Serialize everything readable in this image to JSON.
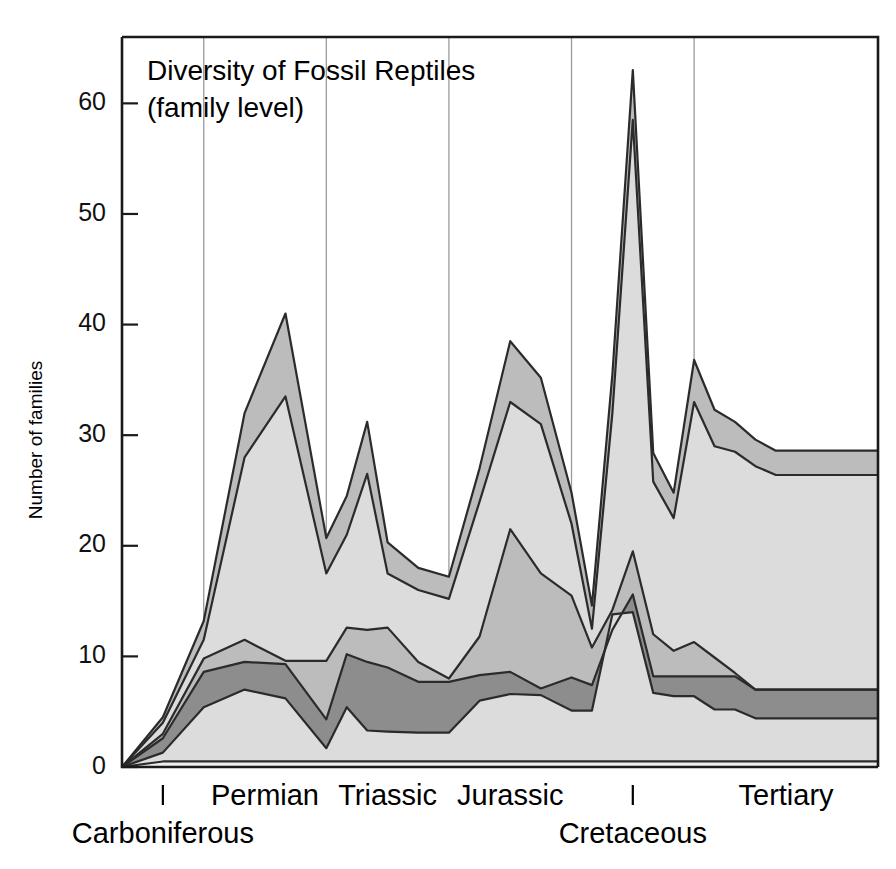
{
  "title": {
    "line1": "Diversity of Fossil Reptiles",
    "line2": "(family level)"
  },
  "axes": {
    "y_title": "Number of families",
    "y_ticks": [
      "0",
      "10",
      "20",
      "30",
      "40",
      "50",
      "60"
    ],
    "y_tick_values": [
      0,
      10,
      20,
      30,
      40,
      50,
      60
    ],
    "y_min": 0,
    "y_max": 66,
    "x_min": 0,
    "x_max": 37
  },
  "periods": [
    {
      "name": "Carboniferous",
      "label": "Carboniferous",
      "start": 0,
      "end": 4,
      "label_row": 2
    },
    {
      "name": "Permian",
      "label": "Permian",
      "start": 4,
      "end": 10,
      "label_row": 1
    },
    {
      "name": "Triassic",
      "label": "Triassic",
      "start": 10,
      "end": 16,
      "label_row": 1
    },
    {
      "name": "Jurassic",
      "label": "Jurassic",
      "start": 16,
      "end": 22,
      "label_row": 1
    },
    {
      "name": "Cretaceous",
      "label": "Cretaceous",
      "start": 22,
      "end": 28,
      "label_row": 2
    },
    {
      "name": "Tertiary",
      "label": "Tertiary",
      "start": 28,
      "end": 37,
      "label_row": 1
    }
  ],
  "colors": {
    "band_dark": "#8d8d8d",
    "band_mid": "#bcbcbc",
    "band_light": "#dcdcdc",
    "band_pale": "#eeeeee",
    "band_white": "#ffffff",
    "outline": "#2b2b2b",
    "grid": "#9a9a9a",
    "axis": "#1a1a1a",
    "background": "#ffffff"
  },
  "chart_data": {
    "type": "area",
    "title": "Diversity of Fossil Reptiles (family level)",
    "xlabel": "",
    "ylabel": "Number of families",
    "ylim": [
      0,
      66
    ],
    "xlim": [
      0,
      37
    ],
    "grid": "vertical gridlines at geological period boundaries",
    "legend": "none (stacked/overlapping shaded bands, unlabelled)",
    "x": [
      0,
      2,
      4,
      6,
      8,
      10,
      11,
      12,
      13,
      14.5,
      16,
      17.5,
      19,
      20.5,
      22,
      23,
      24,
      25,
      26,
      27,
      28,
      29,
      30,
      31,
      32,
      33,
      34,
      35,
      36,
      37
    ],
    "series": [
      {
        "name": "total-upper-envelope",
        "shade": "#bcbcbc",
        "values": [
          0,
          4.5,
          13.2,
          32.0,
          41.0,
          20.7,
          24.5,
          31.2,
          20.3,
          18.0,
          17.2,
          27.0,
          38.5,
          35.2,
          24.8,
          14.6,
          35.5,
          63.0,
          28.4,
          24.8,
          36.8,
          32.3,
          31.2,
          29.6,
          28.6,
          28.6,
          28.6,
          28.6,
          28.6,
          28.6
        ]
      },
      {
        "name": "second-envelope",
        "shade": "#dcdcdc",
        "values": [
          0,
          4.0,
          11.5,
          28.0,
          33.5,
          17.5,
          21.0,
          26.5,
          17.5,
          16.0,
          15.2,
          24.0,
          33.0,
          31.0,
          22.0,
          12.5,
          32.0,
          58.5,
          25.8,
          22.5,
          33.0,
          29.0,
          28.5,
          27.2,
          26.4,
          26.4,
          26.4,
          26.4,
          26.4,
          26.4
        ]
      },
      {
        "name": "mid-band-upper",
        "shade": "#bcbcbc",
        "values": [
          0,
          3.0,
          9.8,
          11.5,
          9.6,
          9.6,
          12.6,
          12.4,
          12.6,
          9.5,
          8.0,
          11.8,
          21.5,
          17.5,
          15.5,
          10.8,
          14.2,
          19.5,
          12.0,
          10.5,
          11.3,
          9.9,
          8.5,
          7.0,
          7.0,
          7.0,
          7.0,
          7.0,
          7.0,
          7.0
        ]
      },
      {
        "name": "mid-band-lower",
        "shade": "#8d8d8d",
        "values": [
          0,
          2.6,
          8.6,
          9.5,
          9.3,
          4.3,
          10.2,
          9.5,
          9.0,
          7.7,
          7.7,
          8.3,
          8.6,
          7.1,
          8.1,
          7.4,
          12.4,
          15.6,
          8.2,
          8.2,
          8.2,
          8.2,
          8.2,
          7.0,
          7.0,
          7.0,
          7.0,
          7.0,
          7.0,
          7.0
        ]
      },
      {
        "name": "lower-band-upper",
        "shade": "#dcdcdc",
        "values": [
          0,
          1.3,
          5.4,
          7.0,
          6.2,
          1.7,
          5.4,
          3.3,
          3.2,
          3.1,
          3.1,
          6.0,
          6.6,
          6.5,
          5.1,
          5.1,
          13.8,
          14.0,
          6.7,
          6.4,
          6.4,
          5.2,
          5.2,
          4.4,
          4.4,
          4.4,
          4.4,
          4.4,
          4.4,
          4.4
        ]
      },
      {
        "name": "baseline",
        "shade": "#eeeeee",
        "values": [
          0,
          0.5,
          0.5,
          0.5,
          0.5,
          0.5,
          0.5,
          0.5,
          0.5,
          0.5,
          0.5,
          0.5,
          0.5,
          0.5,
          0.5,
          0.5,
          0.5,
          0.5,
          0.5,
          0.5,
          0.5,
          0.5,
          0.5,
          0.5,
          0.5,
          0.5,
          0.5,
          0.5,
          0.5,
          0.5
        ]
      }
    ],
    "notes": [
      "Peak of 41 families in the late Permian",
      "Sharp decline to ~21 at the Permian-Triassic boundary",
      "Secondary Triassic peak of ~31",
      "Maximum peak of ~63 families in the Cretaceous",
      "Plateau of ~28-29 families through the Tertiary"
    ]
  }
}
